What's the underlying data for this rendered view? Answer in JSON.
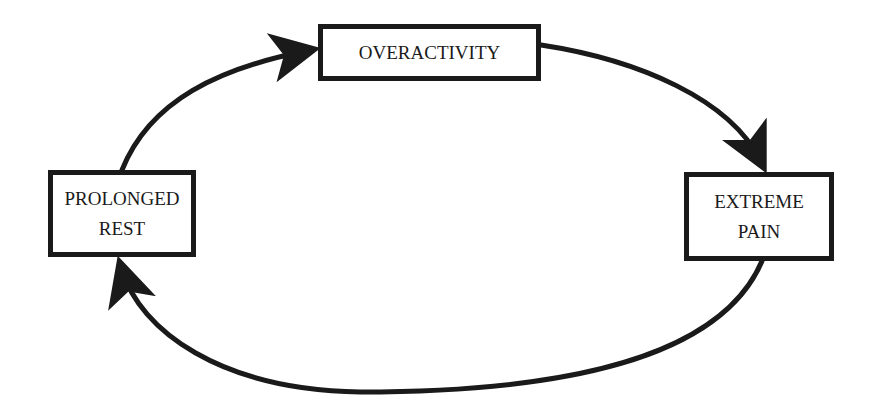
{
  "diagram": {
    "type": "cycle",
    "nodes": [
      {
        "id": "overactivity",
        "lines": [
          "OVERACTIVITY"
        ]
      },
      {
        "id": "extreme-pain",
        "lines": [
          "EXTREME",
          "PAIN"
        ]
      },
      {
        "id": "prolonged-rest",
        "lines": [
          "PROLONGED",
          "REST"
        ]
      }
    ],
    "edges": [
      {
        "from": "overactivity",
        "to": "extreme-pain"
      },
      {
        "from": "extreme-pain",
        "to": "prolonged-rest"
      },
      {
        "from": "prolonged-rest",
        "to": "overactivity"
      }
    ],
    "colors": {
      "stroke": "#1a1a1a",
      "background": "#ffffff"
    }
  }
}
